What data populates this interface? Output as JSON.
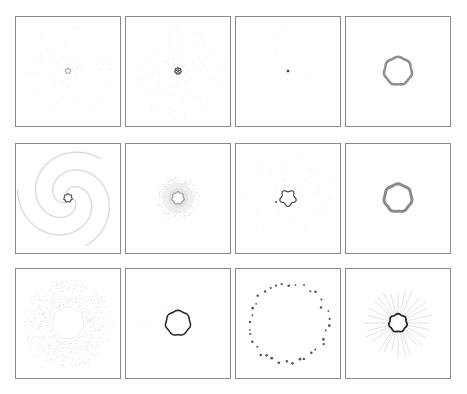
{
  "figure": {
    "rows": 3,
    "cols": 4,
    "background": "#ffffff",
    "border_color": "#8a8a8a",
    "panels": [
      {
        "row": 0,
        "col": 0,
        "x": 15,
        "y": 16,
        "pattern": "faint-radial-dots-small-ring",
        "ring_r": 2.5,
        "ring_color": "#777777",
        "ring_width": 0.8,
        "dots": 120,
        "dot_color": "#d6d6d6",
        "spread": 48,
        "spiral": 0.6,
        "rays": 0
      },
      {
        "row": 0,
        "col": 1,
        "x": 125,
        "y": 16,
        "pattern": "faint-spiral-dots-star-core",
        "ring_r": 3,
        "ring_color": "#555555",
        "ring_width": 1.2,
        "dots": 160,
        "dot_color": "#d0d0d0",
        "spread": 50,
        "spiral": 1.2,
        "rays": 0,
        "star": true
      },
      {
        "row": 0,
        "col": 2,
        "x": 235,
        "y": 16,
        "pattern": "faint-dots-point-center",
        "ring_r": 0.8,
        "ring_color": "#444444",
        "ring_width": 1,
        "dots": 70,
        "dot_color": "#e2e2e2",
        "spread": 48,
        "spiral": 0.3,
        "rays": 0
      },
      {
        "row": 0,
        "col": 3,
        "x": 345,
        "y": 16,
        "pattern": "thick-ring",
        "ring_r": 14,
        "ring_color": "#8f8f8f",
        "ring_width": 2.6,
        "dots": 40,
        "dot_color": "#e4e4e4",
        "spread": 48,
        "spiral": 0,
        "rays": 0
      },
      {
        "row": 1,
        "col": 0,
        "x": 15,
        "y": 143,
        "pattern": "spiral-arms",
        "ring_r": 4,
        "ring_color": "#555555",
        "ring_width": 1.2,
        "dots": 0,
        "dot_color": "#dadada",
        "spread": 52,
        "spiral": 3,
        "rays": 0,
        "arms": 3
      },
      {
        "row": 1,
        "col": 1,
        "x": 125,
        "y": 143,
        "pattern": "diffuse-halo",
        "ring_r": 6,
        "ring_color": "#aaaaaa",
        "ring_width": 1.5,
        "dots": 400,
        "dot_color": "#cfcfcf",
        "spread": 22,
        "spiral": 0,
        "rays": 0
      },
      {
        "row": 1,
        "col": 2,
        "x": 235,
        "y": 143,
        "pattern": "wobbly-ring-with-dots",
        "ring_r": 7.5,
        "ring_color": "#333333",
        "ring_width": 1.1,
        "dots": 110,
        "dot_color": "#d8d8d8",
        "spread": 48,
        "spiral": 0.8,
        "rays": 0,
        "outlier": true
      },
      {
        "row": 1,
        "col": 3,
        "x": 345,
        "y": 143,
        "pattern": "thick-ring",
        "ring_r": 14,
        "ring_color": "#8a8a8a",
        "ring_width": 3,
        "dots": 40,
        "dot_color": "#e4e4e4",
        "spread": 48,
        "spiral": 0,
        "rays": 0
      },
      {
        "row": 2,
        "col": 0,
        "x": 15,
        "y": 268,
        "pattern": "dense-dotted-annulus",
        "ring_r": 16,
        "ring_color": "#d6d6d6",
        "ring_width": 0.5,
        "dots": 900,
        "dot_color": "#d4d4d4",
        "spread": 46,
        "spiral": 1.5,
        "rays": 0,
        "inner": 18
      },
      {
        "row": 2,
        "col": 1,
        "x": 125,
        "y": 268,
        "pattern": "dark-ring",
        "ring_r": 12.5,
        "ring_color": "#222222",
        "ring_width": 1.5,
        "dots": 60,
        "dot_color": "#e4e4e4",
        "spread": 48,
        "spiral": 0,
        "rays": 0
      },
      {
        "row": 2,
        "col": 2,
        "x": 235,
        "y": 268,
        "pattern": "clustered-large-ring",
        "ring_r": 40,
        "ring_color": "#666666",
        "ring_width": 0,
        "dots": 36,
        "dot_color": "#555555",
        "spread": 48,
        "spiral": 0,
        "rays": 0
      },
      {
        "row": 2,
        "col": 3,
        "x": 345,
        "y": 268,
        "pattern": "ring-with-rays",
        "ring_r": 9,
        "ring_color": "#222222",
        "ring_width": 1.8,
        "dots": 0,
        "dot_color": "#cccccc",
        "spread": 48,
        "spiral": 0,
        "rays": 28,
        "ray_len": 28
      }
    ]
  }
}
